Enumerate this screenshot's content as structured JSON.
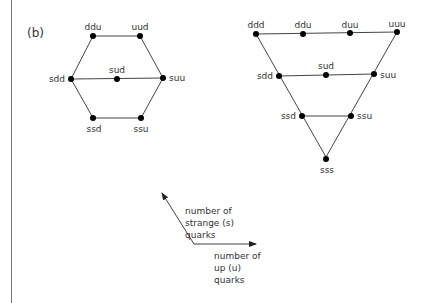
{
  "panel_label": "(b)",
  "hexagon": {
    "nodes": [
      {
        "id": "ddu",
        "label": "ddu"
      },
      {
        "id": "uud",
        "label": "uud"
      },
      {
        "id": "sdd",
        "label": "sdd"
      },
      {
        "id": "sud",
        "label": "sud"
      },
      {
        "id": "suu",
        "label": "suu"
      },
      {
        "id": "ssd",
        "label": "ssd"
      },
      {
        "id": "ssu",
        "label": "ssu"
      }
    ]
  },
  "triangle": {
    "nodes": [
      {
        "id": "ddd",
        "label": "ddd"
      },
      {
        "id": "ddu",
        "label": "ddu"
      },
      {
        "id": "duu",
        "label": "duu"
      },
      {
        "id": "uuu",
        "label": "uuu"
      },
      {
        "id": "sdd",
        "label": "sdd"
      },
      {
        "id": "sud",
        "label": "sud"
      },
      {
        "id": "suu",
        "label": "suu"
      },
      {
        "id": "ssd",
        "label": "ssd"
      },
      {
        "id": "ssu",
        "label": "ssu"
      },
      {
        "id": "sss",
        "label": "sss"
      }
    ]
  },
  "axes": {
    "strange_label": [
      "number of",
      "strange (s)",
      "quarks"
    ],
    "up_label": [
      "number of",
      "up (u)",
      "quarks"
    ]
  }
}
